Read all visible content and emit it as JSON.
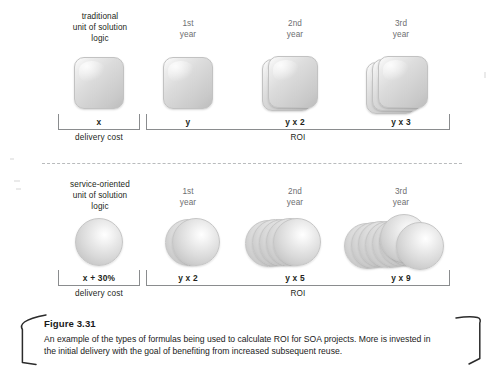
{
  "figure": {
    "number_label": "Figure 3.31",
    "caption_line_1": "An example of the types of formulas being used to calculate ROI for SOA projects. More is invested in",
    "caption_line_2": "the initial delivery with the goal of benefiting from increased subsequent reuse."
  },
  "colors": {
    "heading_grey": "#6d6e71",
    "text_black": "#231f20",
    "bracket_grey": "#8a8c8e",
    "divider_grey": "#b9bbbd",
    "shape_light": "#fdfdfd",
    "shape_dark": "#bdbdbd"
  },
  "rows": [
    {
      "id": "traditional",
      "unit_label_line_1": "traditional",
      "unit_label_line_2": "unit of solution",
      "unit_label_line_3": "logic",
      "shape": "cube",
      "delivery": {
        "formula": "x",
        "axis_label": "delivery cost"
      },
      "roi": {
        "axis_label": "ROI",
        "columns": [
          {
            "head_line_1": "1st",
            "head_line_2": "year",
            "formula": "y",
            "count": 1
          },
          {
            "head_line_1": "2nd",
            "head_line_2": "year",
            "formula": "y x 2",
            "count": 2
          },
          {
            "head_line_1": "3rd",
            "head_line_2": "year",
            "formula": "y x 3",
            "count": 3
          }
        ]
      }
    },
    {
      "id": "service-oriented",
      "unit_label_line_1": "service-oriented",
      "unit_label_line_2": "unit of solution",
      "unit_label_line_3": "logic",
      "shape": "sphere",
      "delivery": {
        "formula": "x + 30%",
        "axis_label": "delivery cost"
      },
      "roi": {
        "axis_label": "ROI",
        "columns": [
          {
            "head_line_1": "1st",
            "head_line_2": "year",
            "formula": "y x 2",
            "count": 2
          },
          {
            "head_line_1": "2nd",
            "head_line_2": "year",
            "formula": "y x 5",
            "count": 5
          },
          {
            "head_line_1": "3rd",
            "head_line_2": "year",
            "formula": "y x 9",
            "count": 9
          }
        ]
      }
    }
  ]
}
